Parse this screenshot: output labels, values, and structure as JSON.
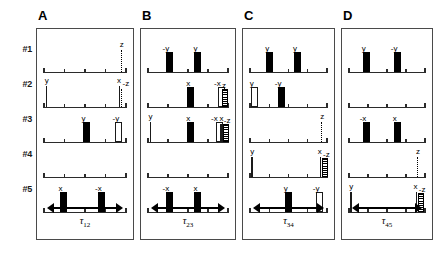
{
  "figure": {
    "row_labels": [
      "#1",
      "#2",
      "#3",
      "#4",
      "#5"
    ],
    "colors": {
      "pulse_filled": "#000000",
      "pulse_open": "#ffffff",
      "axis": "#2b2b2b",
      "frame": "#4a4a4a",
      "background": "#ffffff"
    }
  },
  "chart_data": {
    "type": "table",
    "xlabel": "time",
    "ylabel": "channel",
    "row_labels": [
      "#1",
      "#2",
      "#3",
      "#4",
      "#5"
    ],
    "panels": [
      {
        "letter": "A",
        "tau_label": "τ",
        "tau_sub": "12",
        "rows": [
          {
            "row": "#1",
            "pulses": [
              {
                "label": "z",
                "pos": 0.935,
                "style": "dotted",
                "height": 22,
                "label_dx": -1,
                "label_dy": -9
              }
            ]
          },
          {
            "row": "#2",
            "pulses": [
              {
                "label": "y",
                "pos": 0.02,
                "style": "thin",
                "height": 21,
                "label_dx": -1,
                "label_dy": -9
              },
              {
                "label": "x",
                "pos": 0.915,
                "style": "thin",
                "height": 21,
                "label_dx": -2,
                "label_dy": -9
              },
              {
                "label": "-z",
                "pos": 0.945,
                "style": "dotted",
                "height": 18,
                "label_dx": 1,
                "label_dy": -9
              }
            ]
          },
          {
            "row": "#3",
            "pulses": [
              {
                "label": "y",
                "pos": 0.47,
                "style": "filled",
                "height": 18,
                "width": 5,
                "label_dx": -1,
                "label_dy": -9
              },
              {
                "label": "-y",
                "pos": 0.86,
                "style": "open",
                "height": 18,
                "width": 5,
                "label_dx": -2,
                "label_dy": -9
              }
            ]
          },
          {
            "row": "#4",
            "pulses": []
          },
          {
            "row": "#5",
            "pulses": [
              {
                "label": "x",
                "pos": 0.19,
                "style": "filled",
                "height": 18,
                "width": 5,
                "label_dx": -1,
                "label_dy": -9
              },
              {
                "label": "-x",
                "pos": 0.66,
                "style": "filled",
                "height": 18,
                "width": 5,
                "label_dx": -3,
                "label_dy": -9
              }
            ]
          }
        ]
      },
      {
        "letter": "B",
        "tau_label": "τ",
        "tau_sub": "23",
        "rows": [
          {
            "row": "#1",
            "pulses": [
              {
                "label": "-y",
                "pos": 0.22,
                "style": "filled",
                "height": 18,
                "width": 5,
                "label_dx": -3,
                "label_dy": -9
              },
              {
                "label": "y",
                "pos": 0.58,
                "style": "filled",
                "height": 18,
                "width": 5,
                "label_dx": -1,
                "label_dy": -9
              }
            ]
          },
          {
            "row": "#2",
            "pulses": [
              {
                "label": "x",
                "pos": 0.49,
                "style": "filled",
                "height": 18,
                "width": 5,
                "label_dx": -1,
                "label_dy": -9
              },
              {
                "label": "-x",
                "pos": 0.875,
                "style": "open",
                "height": 18,
                "width": 5,
                "label_dx": -4,
                "label_dy": -9
              },
              {
                "label": "z",
                "pos": 0.925,
                "style": "hatch",
                "height": 16,
                "width": 4,
                "label_dx": 0,
                "label_dy": -9
              }
            ]
          },
          {
            "row": "#3",
            "pulses": [
              {
                "label": "y",
                "pos": 0.02,
                "style": "thin",
                "height": 20,
                "label_dx": -1,
                "label_dy": -9
              },
              {
                "label": "x",
                "pos": 0.49,
                "style": "filled",
                "height": 18,
                "width": 5,
                "label_dx": -1,
                "label_dy": -9
              },
              {
                "label": "-x",
                "pos": 0.85,
                "style": "open",
                "height": 18,
                "width": 5,
                "label_dx": -5,
                "label_dy": -9
              },
              {
                "label": "x",
                "pos": 0.905,
                "style": "thin",
                "height": 18,
                "label_dx": -1,
                "label_dy": -9
              },
              {
                "label": "-z",
                "pos": 0.935,
                "style": "hatch",
                "height": 16,
                "width": 4,
                "label_dx": 1,
                "label_dy": -9
              }
            ]
          },
          {
            "row": "#4",
            "pulses": []
          },
          {
            "row": "#5",
            "pulses": [
              {
                "label": "-x",
                "pos": 0.22,
                "style": "filled",
                "height": 18,
                "width": 5,
                "label_dx": -3,
                "label_dy": -9
              },
              {
                "label": "x",
                "pos": 0.58,
                "style": "filled",
                "height": 18,
                "width": 5,
                "label_dx": -1,
                "label_dy": -9
              }
            ]
          }
        ]
      },
      {
        "letter": "C",
        "tau_label": "τ",
        "tau_sub": "34",
        "rows": [
          {
            "row": "#1",
            "pulses": [
              {
                "label": "y",
                "pos": 0.21,
                "style": "filled",
                "height": 18,
                "width": 5,
                "label_dx": -1,
                "label_dy": -9
              },
              {
                "label": "y",
                "pos": 0.57,
                "style": "filled",
                "height": 18,
                "width": 5,
                "label_dx": -1,
                "label_dy": -9
              }
            ]
          },
          {
            "row": "#2",
            "pulses": [
              {
                "label": "y",
                "pos": 0.01,
                "style": "open",
                "height": 18,
                "width": 5,
                "label_dx": -1,
                "label_dy": -9
              },
              {
                "label": "-y",
                "pos": 0.36,
                "style": "filled",
                "height": 18,
                "width": 5,
                "label_dx": -3,
                "label_dy": -9
              }
            ]
          },
          {
            "row": "#3",
            "pulses": [
              {
                "label": "z",
                "pos": 0.925,
                "style": "dotted",
                "height": 20,
                "label_dx": -1,
                "label_dy": -9
              }
            ]
          },
          {
            "row": "#4",
            "pulses": [
              {
                "label": "y",
                "pos": 0.015,
                "style": "thin",
                "height": 20,
                "label_dx": -1,
                "label_dy": -9
              },
              {
                "label": "x",
                "pos": 0.905,
                "style": "thin",
                "height": 20,
                "label_dx": -2,
                "label_dy": -9
              },
              {
                "label": "-z",
                "pos": 0.935,
                "style": "hatch",
                "height": 17,
                "width": 4,
                "label_dx": 1,
                "label_dy": -9
              }
            ]
          },
          {
            "row": "#5",
            "pulses": [
              {
                "label": "y",
                "pos": 0.45,
                "style": "filled",
                "height": 18,
                "width": 5,
                "label_dx": -1,
                "label_dy": -9
              },
              {
                "label": "-y",
                "pos": 0.855,
                "style": "open",
                "height": 18,
                "width": 5,
                "label_dx": -3,
                "label_dy": -9
              }
            ]
          }
        ]
      },
      {
        "letter": "D",
        "tau_label": "τ",
        "tau_sub": "45",
        "rows": [
          {
            "row": "#1",
            "pulses": [
              {
                "label": "y",
                "pos": 0.18,
                "style": "filled",
                "height": 18,
                "width": 5,
                "label_dx": -1,
                "label_dy": -9
              },
              {
                "label": "-y",
                "pos": 0.59,
                "style": "filled",
                "height": 18,
                "width": 5,
                "label_dx": -3,
                "label_dy": -9
              }
            ]
          },
          {
            "row": "#2",
            "pulses": []
          },
          {
            "row": "#3",
            "pulses": [
              {
                "label": "-x",
                "pos": 0.18,
                "style": "filled",
                "height": 18,
                "width": 5,
                "label_dx": -3,
                "label_dy": -9
              },
              {
                "label": "x",
                "pos": 0.59,
                "style": "filled",
                "height": 18,
                "width": 5,
                "label_dx": -1,
                "label_dy": -9
              }
            ]
          },
          {
            "row": "#4",
            "pulses": [
              {
                "label": "z",
                "pos": 0.895,
                "style": "dotted",
                "height": 20,
                "label_dx": -1,
                "label_dy": -9
              }
            ]
          },
          {
            "row": "#5",
            "pulses": [
              {
                "label": "y",
                "pos": 0.015,
                "style": "thin",
                "height": 20,
                "label_dx": -1,
                "label_dy": -9
              },
              {
                "label": "x",
                "pos": 0.875,
                "style": "thin",
                "height": 20,
                "label_dx": -2,
                "label_dy": -9
              },
              {
                "label": "-z",
                "pos": 0.905,
                "style": "hatch",
                "height": 17,
                "width": 4,
                "label_dx": 1,
                "label_dy": -9
              }
            ]
          }
        ]
      }
    ]
  }
}
